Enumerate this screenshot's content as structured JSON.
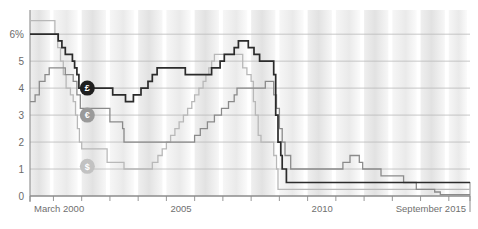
{
  "chart_data": {
    "type": "line",
    "title": "",
    "subtitle": "",
    "xlabel": "",
    "ylabel": "",
    "grid": true,
    "legend_position": "inline-markers",
    "xlim": [
      2000.17,
      2015.75
    ],
    "ylim": [
      0,
      6.6
    ],
    "y_ticks": [
      0,
      1,
      2,
      3,
      4,
      5,
      6
    ],
    "y_tick_labels": [
      "0",
      "1",
      "2",
      "3",
      "4",
      "5",
      "6%"
    ],
    "x_ticks": [
      2000.17,
      2001,
      2002,
      2003,
      2004,
      2005,
      2006,
      2007,
      2008,
      2009,
      2010,
      2011,
      2012,
      2013,
      2014,
      2015,
      2015.75
    ],
    "x_tick_labels": [
      "March 2000",
      "",
      "",
      "",
      "",
      "2005",
      "",
      "",
      "",
      "",
      "2010",
      "",
      "",
      "",
      "",
      "",
      "September 2015"
    ],
    "x_labeled_ticks": [
      {
        "x": 2000.17,
        "label": "March 2000"
      },
      {
        "x": 2005.0,
        "label": "2005"
      },
      {
        "x": 2010.0,
        "label": "2010"
      },
      {
        "x": 2015.75,
        "label": "September 2015"
      }
    ],
    "step_style": "post",
    "series": [
      {
        "name": "Pound sterling",
        "symbol": "£",
        "color": "#2b2b2b",
        "marker_label_x": 2002.2,
        "marker_label_y": 4.0,
        "points": [
          [
            2000.17,
            6.0
          ],
          [
            2000.3,
            6.0
          ],
          [
            2001.0,
            6.0
          ],
          [
            2001.17,
            5.75
          ],
          [
            2001.3,
            5.5
          ],
          [
            2001.42,
            5.25
          ],
          [
            2001.55,
            5.25
          ],
          [
            2001.67,
            5.0
          ],
          [
            2001.75,
            4.75
          ],
          [
            2001.83,
            4.5
          ],
          [
            2001.9,
            4.0
          ],
          [
            2002.0,
            4.0
          ],
          [
            2002.2,
            4.0
          ],
          [
            2002.9,
            4.0
          ],
          [
            2003.1,
            3.75
          ],
          [
            2003.55,
            3.5
          ],
          [
            2003.83,
            3.75
          ],
          [
            2004.1,
            4.0
          ],
          [
            2004.35,
            4.25
          ],
          [
            2004.5,
            4.5
          ],
          [
            2004.67,
            4.75
          ],
          [
            2005.3,
            4.75
          ],
          [
            2005.67,
            4.5
          ],
          [
            2006.6,
            4.75
          ],
          [
            2006.9,
            5.0
          ],
          [
            2007.05,
            5.25
          ],
          [
            2007.4,
            5.5
          ],
          [
            2007.55,
            5.75
          ],
          [
            2007.9,
            5.5
          ],
          [
            2008.1,
            5.25
          ],
          [
            2008.3,
            5.0
          ],
          [
            2008.8,
            4.5
          ],
          [
            2008.87,
            3.0
          ],
          [
            2008.95,
            2.0
          ],
          [
            2009.05,
            1.5
          ],
          [
            2009.1,
            1.0
          ],
          [
            2009.25,
            0.5
          ],
          [
            2012.0,
            0.5
          ],
          [
            2015.75,
            0.5
          ]
        ]
      },
      {
        "name": "Euro",
        "symbol": "€",
        "color": "#8a8a8a",
        "marker_label_x": 2002.2,
        "marker_label_y": 3.0,
        "points": [
          [
            2000.17,
            3.5
          ],
          [
            2000.35,
            3.75
          ],
          [
            2000.5,
            4.25
          ],
          [
            2000.7,
            4.5
          ],
          [
            2000.85,
            4.75
          ],
          [
            2001.3,
            4.75
          ],
          [
            2001.42,
            4.5
          ],
          [
            2001.7,
            4.25
          ],
          [
            2001.83,
            3.75
          ],
          [
            2001.95,
            3.25
          ],
          [
            2002.2,
            3.25
          ],
          [
            2002.9,
            3.25
          ],
          [
            2003.0,
            2.75
          ],
          [
            2003.45,
            2.5
          ],
          [
            2003.5,
            2.0
          ],
          [
            2005.95,
            2.0
          ],
          [
            2006.0,
            2.25
          ],
          [
            2006.2,
            2.5
          ],
          [
            2006.45,
            2.75
          ],
          [
            2006.7,
            3.0
          ],
          [
            2006.95,
            3.25
          ],
          [
            2007.2,
            3.5
          ],
          [
            2007.4,
            3.75
          ],
          [
            2007.5,
            4.0
          ],
          [
            2008.5,
            4.25
          ],
          [
            2008.8,
            3.75
          ],
          [
            2008.9,
            3.25
          ],
          [
            2009.0,
            2.5
          ],
          [
            2009.1,
            2.0
          ],
          [
            2009.2,
            1.5
          ],
          [
            2009.4,
            1.0
          ],
          [
            2011.25,
            1.25
          ],
          [
            2011.5,
            1.5
          ],
          [
            2011.83,
            1.25
          ],
          [
            2011.95,
            1.0
          ],
          [
            2012.6,
            0.75
          ],
          [
            2013.4,
            0.5
          ],
          [
            2013.85,
            0.25
          ],
          [
            2014.5,
            0.15
          ],
          [
            2014.7,
            0.05
          ],
          [
            2015.75,
            0.05
          ]
        ]
      },
      {
        "name": "US dollar",
        "symbol": "$",
        "color": "#b8b8b8",
        "marker_label_x": 2002.2,
        "marker_label_y": 1.1,
        "points": [
          [
            2000.17,
            6.5
          ],
          [
            2000.4,
            6.5
          ],
          [
            2001.0,
            6.5
          ],
          [
            2001.05,
            6.0
          ],
          [
            2001.15,
            5.5
          ],
          [
            2001.25,
            5.0
          ],
          [
            2001.35,
            4.5
          ],
          [
            2001.45,
            4.0
          ],
          [
            2001.6,
            3.75
          ],
          [
            2001.7,
            3.5
          ],
          [
            2001.78,
            3.0
          ],
          [
            2001.85,
            2.5
          ],
          [
            2001.92,
            2.0
          ],
          [
            2002.0,
            1.75
          ],
          [
            2002.2,
            1.75
          ],
          [
            2002.9,
            1.25
          ],
          [
            2003.5,
            1.0
          ],
          [
            2004.5,
            1.25
          ],
          [
            2004.7,
            1.5
          ],
          [
            2004.85,
            1.75
          ],
          [
            2005.0,
            2.0
          ],
          [
            2005.15,
            2.25
          ],
          [
            2005.3,
            2.5
          ],
          [
            2005.45,
            2.75
          ],
          [
            2005.6,
            3.0
          ],
          [
            2005.75,
            3.25
          ],
          [
            2005.9,
            3.5
          ],
          [
            2006.0,
            3.75
          ],
          [
            2006.15,
            4.0
          ],
          [
            2006.3,
            4.25
          ],
          [
            2006.4,
            4.5
          ],
          [
            2006.5,
            4.75
          ],
          [
            2006.6,
            5.0
          ],
          [
            2006.7,
            5.25
          ],
          [
            2007.6,
            5.25
          ],
          [
            2007.7,
            4.75
          ],
          [
            2007.85,
            4.5
          ],
          [
            2008.0,
            4.25
          ],
          [
            2008.08,
            3.5
          ],
          [
            2008.15,
            3.0
          ],
          [
            2008.25,
            2.25
          ],
          [
            2008.35,
            2.0
          ],
          [
            2008.8,
            1.5
          ],
          [
            2008.9,
            1.0
          ],
          [
            2008.95,
            0.25
          ],
          [
            2015.75,
            0.25
          ]
        ]
      }
    ]
  },
  "axis": {
    "y_unit_label": "6%",
    "x_start_label": "March 2000",
    "x_mid_label": "2005",
    "x_second_mid_label": "2010",
    "x_end_label": "September 2015"
  },
  "markers": [
    {
      "symbol": "£",
      "name": "pound-marker",
      "color": "#1f1f1f",
      "text_color": "#ffffff"
    },
    {
      "symbol": "€",
      "name": "euro-marker",
      "color": "#9a9a9a",
      "text_color": "#ffffff"
    },
    {
      "symbol": "$",
      "name": "dollar-marker",
      "color": "#c2c2c2",
      "text_color": "#ffffff"
    }
  ],
  "colors": {
    "pound": "#2b2b2b",
    "euro": "#8a8a8a",
    "dollar": "#b8b8b8",
    "grid": "#b9b9b9",
    "band": "#e4e4e4",
    "axis": "#8c8c8c",
    "text": "#6f6f6f"
  }
}
